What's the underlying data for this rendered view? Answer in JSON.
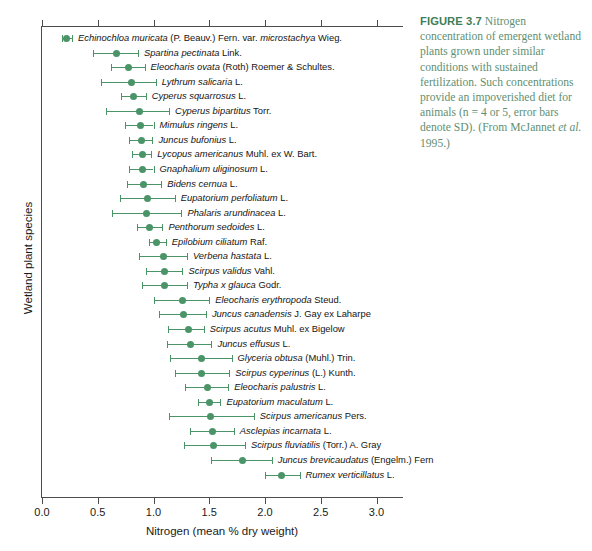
{
  "figure": {
    "caption_label": "FIGURE 3.7",
    "caption_text": " Nitrogen concentration of emergent wetland plants grown under similar conditions with sustained fertilization. Such concentrations provide an impoverished diet for animals (n = 4 or 5, error bars denote SD). (From McJannet ",
    "caption_italic": "et al.",
    "caption_tail": " 1995.)",
    "accent_color": "#4a9468",
    "caption_color": "#5f8f72"
  },
  "chart_data": {
    "type": "scatter",
    "title": "",
    "xlabel": "Nitrogen (mean % dry weight)",
    "ylabel": "Wetland plant species",
    "xlim": [
      0.0,
      3.25
    ],
    "xticks": [
      0.0,
      0.5,
      1.0,
      1.5,
      2.0,
      2.5,
      3.0
    ],
    "xticklabels": [
      "0.0",
      "0.5",
      "1.0",
      "1.5",
      "2.0",
      "2.5",
      "3.0"
    ],
    "grid": false,
    "legend": "none",
    "error_bars": "SD",
    "n": "4 or 5",
    "categories": [
      "Echinochloa muricata (P. Beauv.) Fern. var. microstachya Wieg.",
      "Spartina pectinata Link.",
      "Eleocharis ovata (Roth) Roemer & Schultes.",
      "Lythrum salicaria L.",
      "Cyperus squarrosus L.",
      "Cyperus bipartitus Torr.",
      "Mimulus ringens L.",
      "Juncus bufonius L.",
      "Lycopus americanus Muhl. ex W. Bart.",
      "Gnaphalium uliginosum L.",
      "Bidens cernua L.",
      "Eupatorium perfoliatum L.",
      "Phalaris arundinacea L.",
      "Penthorum sedoides L.",
      "Epilobium ciliatum Raf.",
      "Verbena hastata L.",
      "Scirpus validus Vahl.",
      "Typha x glauca Godr.",
      "Eleocharis erythropoda Steud.",
      "Juncus canadensis J. Gay ex Laharpe",
      "Scirpus acutus Muhl. ex Bigelow",
      "Juncus effusus L.",
      "Glyceria obtusa (Muhl.) Trin.",
      "Scirpus cyperinus (L.) Kunth.",
      "Eleocharis palustris L.",
      "Eupatorium maculatum L.",
      "Scirpus americanus Pers.",
      "Asclepias incarnata L.",
      "Scirpus fluviatilis (Torr.) A. Gray",
      "Juncus brevicaudatus (Engelm.) Fern",
      "Rumex verticillatus L."
    ],
    "points": [
      {
        "species": "Echinochloa muricata (P. Beauv.) Fern. var. microstachya Wieg.",
        "italic": "Echinochloa muricata",
        "rest": " (P. Beauv.) Fern. var. ",
        "italic2": "microstachya",
        "rest2": " Wieg.",
        "mean": 0.22,
        "low": 0.18,
        "high": 0.27
      },
      {
        "species": "Spartina pectinata Link.",
        "italic": "Spartina pectinata",
        "rest": " Link.",
        "mean": 0.67,
        "low": 0.46,
        "high": 0.86
      },
      {
        "species": "Eleocharis ovata (Roth) Roemer & Schultes.",
        "italic": "Eleocharis ovata",
        "rest": " (Roth) Roemer & Schultes.",
        "mean": 0.78,
        "low": 0.62,
        "high": 0.92
      },
      {
        "species": "Lythrum salicaria L.",
        "italic": "Lythrum salicaria",
        "rest": " L.",
        "mean": 0.8,
        "low": 0.53,
        "high": 1.02
      },
      {
        "species": "Cyperus squarrosus L.",
        "italic": "Cyperus squarrosus",
        "rest": " L.",
        "mean": 0.82,
        "low": 0.71,
        "high": 0.93
      },
      {
        "species": "Cyperus bipartitus Torr.",
        "italic": "Cyperus bipartitus",
        "rest": " Torr.",
        "mean": 0.87,
        "low": 0.57,
        "high": 1.14
      },
      {
        "species": "Mimulus ringens L.",
        "italic": "Mimulus ringens",
        "rest": " L.",
        "mean": 0.88,
        "low": 0.74,
        "high": 1.0
      },
      {
        "species": "Juncus bufonius L.",
        "italic": "Juncus bufonius",
        "rest": " L.",
        "mean": 0.89,
        "low": 0.78,
        "high": 0.99
      },
      {
        "species": "Lycopus americanus Muhl. ex W. Bart.",
        "italic": "Lycopus americanus",
        "rest": " Muhl. ex W. Bart.",
        "mean": 0.9,
        "low": 0.81,
        "high": 0.98
      },
      {
        "species": "Gnaphalium uliginosum L.",
        "italic": "Gnaphalium uliginosum",
        "rest": " L.",
        "mean": 0.9,
        "low": 0.78,
        "high": 1.0
      },
      {
        "species": "Bidens cernua L.",
        "italic": "Bidens cernua",
        "rest": " L.",
        "mean": 0.91,
        "low": 0.76,
        "high": 1.07
      },
      {
        "species": "Eupatorium perfoliatum L.",
        "italic": "Eupatorium perfoliatum",
        "rest": " L.",
        "mean": 0.95,
        "low": 0.7,
        "high": 1.19
      },
      {
        "species": "Phalaris arundinacea L.",
        "italic": "Phalaris arundinacea",
        "rest": " L.",
        "mean": 0.94,
        "low": 0.63,
        "high": 1.25
      },
      {
        "species": "Penthorum sedoides L.",
        "italic": "Penthorum sedoides",
        "rest": " L.",
        "mean": 0.96,
        "low": 0.85,
        "high": 1.08
      },
      {
        "species": "Epilobium ciliatum Raf.",
        "italic": "Epilobium ciliatum",
        "rest": " Raf.",
        "mean": 1.03,
        "low": 0.96,
        "high": 1.11
      },
      {
        "species": "Verbena hastata L.",
        "italic": "Verbena hastata",
        "rest": " L.",
        "mean": 1.09,
        "low": 0.87,
        "high": 1.3
      },
      {
        "species": "Scirpus validus Vahl.",
        "italic": "Scirpus validus",
        "rest": " Vahl.",
        "mean": 1.1,
        "low": 0.93,
        "high": 1.26
      },
      {
        "species": "Typha x glauca Godr.",
        "italic": "Typha x glauca",
        "rest": " Godr.",
        "mean": 1.1,
        "low": 0.9,
        "high": 1.3
      },
      {
        "species": "Eleocharis erythropoda Steud.",
        "italic": "Eleocharis erythropoda",
        "rest": " Steud.",
        "mean": 1.26,
        "low": 1.0,
        "high": 1.5
      },
      {
        "species": "Juncus canadensis J. Gay ex Laharpe",
        "italic": "Juncus canadensis",
        "rest": " J. Gay ex Laharpe",
        "mean": 1.27,
        "low": 1.05,
        "high": 1.47
      },
      {
        "species": "Scirpus acutus Muhl. ex Bigelow",
        "italic": "Scirpus acutus",
        "rest": " Muhl. ex Bigelow",
        "mean": 1.31,
        "low": 1.13,
        "high": 1.45
      },
      {
        "species": "Juncus effusus L.",
        "italic": "Juncus effusus",
        "rest": " L.",
        "mean": 1.33,
        "low": 1.12,
        "high": 1.52
      },
      {
        "species": "Glyceria obtusa (Muhl.) Trin.",
        "italic": "Glyceria obtusa",
        "rest": " (Muhl.) Trin.",
        "mean": 1.43,
        "low": 1.15,
        "high": 1.7
      },
      {
        "species": "Scirpus cyperinus (L.) Kunth.",
        "italic": "Scirpus cyperinus",
        "rest": " (L.) Kunth.",
        "mean": 1.43,
        "low": 1.19,
        "high": 1.68
      },
      {
        "species": "Eleocharis palustris L.",
        "italic": "Eleocharis palustris",
        "rest": " L.",
        "mean": 1.48,
        "low": 1.28,
        "high": 1.67
      },
      {
        "species": "Eupatorium maculatum L.",
        "italic": "Eupatorium maculatum",
        "rest": " L.",
        "mean": 1.5,
        "low": 1.4,
        "high": 1.6
      },
      {
        "species": "Scirpus americanus Pers.",
        "italic": "Scirpus americanus",
        "rest": " Pers.",
        "mean": 1.51,
        "low": 1.14,
        "high": 1.9
      },
      {
        "species": "Asclepias incarnata L.",
        "italic": "Asclepias incarnata",
        "rest": " L.",
        "mean": 1.53,
        "low": 1.33,
        "high": 1.72
      },
      {
        "species": "Scirpus fluviatilis (Torr.) A. Gray",
        "italic": "Scirpus fluviatilis",
        "rest": " (Torr.) A. Gray",
        "mean": 1.54,
        "low": 1.27,
        "high": 1.82
      },
      {
        "species": "Juncus brevicaudatus (Engelm.) Fern",
        "italic": "Juncus brevicaudatus",
        "rest": " (Engelm.) Fern",
        "mean": 1.8,
        "low": 1.52,
        "high": 2.06
      },
      {
        "species": "Rumex verticillatus L.",
        "italic": "Rumex verticillatus",
        "rest": " L.",
        "mean": 2.15,
        "low": 2.0,
        "high": 2.31
      }
    ]
  }
}
